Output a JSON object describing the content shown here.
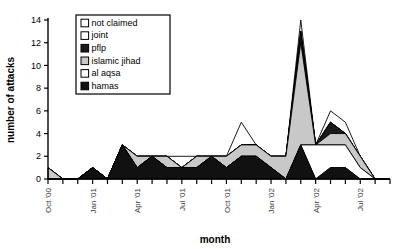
{
  "figure": {
    "background": "#ffffff",
    "axis_color": "#000000"
  },
  "legend": {
    "name": "legend-box",
    "border_color": "#000000",
    "entries": [
      {
        "label": "not claimed",
        "fill": "#ffffff",
        "swatch": "swatch-not-claimed"
      },
      {
        "label": "joint",
        "fill": "#ffffff",
        "swatch": "swatch-joint"
      },
      {
        "label": "pflp",
        "fill": "#1a1a1a",
        "swatch": "swatch-pflp"
      },
      {
        "label": "islamic jihad",
        "fill": "#c8c8c8",
        "swatch": "swatch-islamic-jihad"
      },
      {
        "label": "al aqsa",
        "fill": "#ffffff",
        "swatch": "swatch-al-aqsa"
      },
      {
        "label": "hamas",
        "fill": "#111111",
        "swatch": "swatch-hamas"
      }
    ]
  },
  "chart_data": {
    "type": "area",
    "stacked": true,
    "title": "",
    "xlabel": "month",
    "ylabel": "number of attacks",
    "ylim": [
      0,
      14
    ],
    "yticks": [
      0,
      2,
      4,
      6,
      8,
      10,
      12,
      14
    ],
    "ytick_labels": [
      "0",
      "2",
      "4",
      "6",
      "8",
      "10",
      "12",
      "14"
    ],
    "grid": false,
    "legend_position": "upper-left-inside",
    "x": [
      "Oct '00",
      "Nov '00",
      "Dec '00",
      "Jan '01",
      "Feb '01",
      "Mar '01",
      "Apr '01",
      "May '01",
      "Jun '01",
      "Jul '01",
      "Aug '01",
      "Sep '01",
      "Oct '01",
      "Nov '01",
      "Dec '01",
      "Jan '02",
      "Feb '02",
      "Mar '02",
      "Apr '02",
      "May '02",
      "Jun '02",
      "Jul '02",
      "Aug '02",
      "Sep '02"
    ],
    "xtick_labels_shown": [
      "Oct '00",
      "Jan '01",
      "Apr '01",
      "Jul '01",
      "Oct '01",
      "Jan '02",
      "Apr '02",
      "Jul '02"
    ],
    "xtick_label_indices": [
      0,
      3,
      6,
      9,
      12,
      15,
      18,
      21
    ],
    "series": [
      {
        "name": "hamas",
        "fill": "#111111",
        "values": [
          0,
          0,
          0,
          1,
          0,
          3,
          1,
          2,
          1,
          1,
          1,
          2,
          1,
          2,
          2,
          1,
          0,
          3,
          0,
          1,
          1,
          0,
          0,
          0
        ]
      },
      {
        "name": "al aqsa",
        "fill": "#ffffff",
        "values": [
          0,
          0,
          0,
          0,
          0,
          0,
          0,
          0,
          0,
          0,
          0,
          0,
          0,
          0,
          0,
          0,
          0,
          0,
          3,
          2,
          2,
          1,
          0,
          0
        ]
      },
      {
        "name": "islamic jihad",
        "fill": "#c8c8c8",
        "values": [
          1,
          0,
          0,
          0,
          0,
          0,
          1,
          0,
          1,
          0,
          1,
          0,
          1,
          1,
          1,
          1,
          2,
          9,
          0,
          1,
          1,
          1,
          0,
          0
        ]
      },
      {
        "name": "pflp",
        "fill": "#1a1a1a",
        "values": [
          0,
          0,
          0,
          0,
          0,
          0,
          0,
          0,
          0,
          0,
          0,
          0,
          0,
          0,
          0,
          0,
          0,
          1,
          0,
          1,
          0,
          0,
          0,
          0
        ]
      },
      {
        "name": "joint",
        "fill": "#ffffff",
        "values": [
          0,
          0,
          0,
          0,
          0,
          0,
          0,
          0,
          0,
          0,
          0,
          0,
          0,
          0,
          0,
          0,
          0,
          0,
          0,
          0,
          0,
          0,
          0,
          0
        ]
      },
      {
        "name": "not claimed",
        "fill": "#ffffff",
        "values": [
          0,
          0,
          0,
          0,
          0,
          0,
          0,
          0,
          0,
          1,
          0,
          0,
          0,
          2,
          0,
          0,
          0,
          1,
          0,
          1,
          1,
          0,
          0,
          0
        ]
      }
    ],
    "totals": [
      1,
      0,
      0,
      1,
      0,
      3,
      2,
      2,
      2,
      2,
      2,
      2,
      2,
      5,
      3,
      2,
      2,
      14,
      3,
      5,
      5,
      2,
      0,
      0
    ]
  }
}
